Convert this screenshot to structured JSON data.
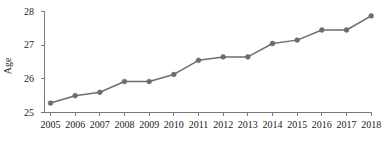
{
  "chart_data": {
    "type": "line",
    "title": "",
    "subtitle": "",
    "xlabel": "",
    "ylabel": "Age",
    "categories": [
      "2005",
      "2006",
      "2007",
      "2008",
      "2009",
      "2010",
      "2011",
      "2012",
      "2013",
      "2014",
      "2015",
      "2016",
      "2017",
      "2018"
    ],
    "x": [
      2005,
      2006,
      2007,
      2008,
      2009,
      2010,
      2011,
      2012,
      2013,
      2014,
      2015,
      2016,
      2017,
      2018
    ],
    "values": [
      25.28,
      25.5,
      25.6,
      25.92,
      25.92,
      26.13,
      26.55,
      26.65,
      26.65,
      27.05,
      27.15,
      27.45,
      27.45,
      27.87
    ],
    "series": [
      {
        "name": "Age",
        "values": [
          25.28,
          25.5,
          25.6,
          25.92,
          25.92,
          26.13,
          26.55,
          26.65,
          26.65,
          27.05,
          27.15,
          27.45,
          27.45,
          27.87
        ]
      }
    ],
    "ylim": [
      25,
      28
    ],
    "yticks": [
      25,
      26,
      27,
      28
    ],
    "ytick_labels": [
      "25",
      "26",
      "27",
      "28"
    ],
    "xtick_labels": [
      "2005",
      "2006",
      "2007",
      "2008",
      "2009",
      "2010",
      "2011",
      "2012",
      "2013",
      "2014",
      "2015",
      "2016",
      "2017",
      "2018"
    ],
    "grid": false,
    "legend": false,
    "legend_position": "none",
    "marker": "circle",
    "line_color": "#6e6e6e",
    "marker_color": "#6e6e6e",
    "axis_color": "#7a7a7a",
    "text_color": "#1a1a1a",
    "background_color": "#ffffff"
  },
  "axes": {
    "y_axis_title": "Age",
    "y_tick_labels": [
      "28",
      "27",
      "26",
      "25"
    ],
    "x_tick_labels": [
      "2005",
      "2006",
      "2007",
      "2008",
      "2009",
      "2010",
      "2011",
      "2012",
      "2013",
      "2014",
      "2015",
      "2016",
      "2017",
      "2018"
    ]
  }
}
